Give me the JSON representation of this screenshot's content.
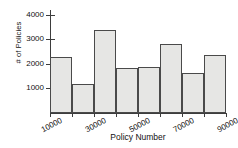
{
  "chart_data": {
    "type": "bar",
    "title": "",
    "xlabel": "Policy Number",
    "ylabel": "# of Policies",
    "categories": [
      "10000",
      "20000",
      "30000",
      "40000",
      "50000",
      "60000",
      "70000",
      "80000"
    ],
    "bin_edges": [
      10000,
      20000,
      30000,
      40000,
      50000,
      60000,
      70000,
      80000,
      90000
    ],
    "values": [
      2300,
      1200,
      3400,
      1850,
      1890,
      2800,
      1650,
      2350
    ],
    "xticks": [
      "10000",
      "30000",
      "50000",
      "70000",
      "90000"
    ],
    "xtick_values": [
      10000,
      30000,
      50000,
      70000,
      90000
    ],
    "yticks": [
      "1000",
      "2000",
      "3000",
      "4000"
    ],
    "ytick_values": [
      1000,
      2000,
      3000,
      4000
    ],
    "xlim": [
      10000,
      90000
    ],
    "ylim": [
      0,
      4200
    ],
    "grid": false,
    "legend": null,
    "bar_fill_color": "#e6e6e4",
    "bar_edge_color": "#4a4a4a",
    "axis_color": "#3d3d3d",
    "background_color": "#ffffff"
  }
}
